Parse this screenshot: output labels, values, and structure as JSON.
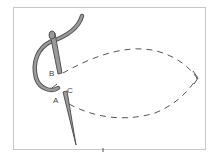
{
  "diagram": {
    "labels": {
      "a": "A",
      "b": "B",
      "c": "C"
    },
    "colors": {
      "frame": "#c8c8c8",
      "thread_outline": "#555555",
      "thread_fill": "#9a9a9a",
      "dash": "#555555"
    }
  }
}
